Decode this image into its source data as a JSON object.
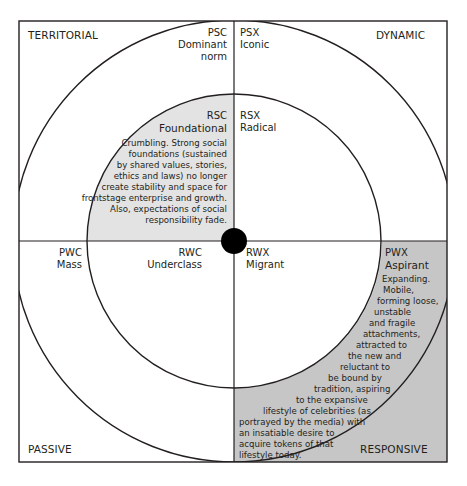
{
  "colors": {
    "background": "#ffffff",
    "line": "#231f20",
    "foundational_fill": "#e3e3e3",
    "aspirant_fill": "#c6c6c6",
    "center_dot": "#000000"
  },
  "corners": {
    "top_left": "TERRITORIAL",
    "top_right": "DYNAMIC",
    "bottom_left": "PASSIVE",
    "bottom_right": "RESPONSIVE"
  },
  "segments": {
    "psc": {
      "code": "PSC",
      "name_1": "Dominant",
      "name_2": "norm"
    },
    "psx": {
      "code": "PSX",
      "name": "Iconic"
    },
    "rsc": {
      "code": "RSC",
      "name": "Foundational",
      "description": [
        "Crumbling. Strong social",
        "foundations (sustained",
        "by shared values, stories,",
        "ethics and laws) no longer",
        "create stability and space for",
        "frontstage enterprise and growth.",
        "Also, expectations of social",
        "responsibility fade."
      ]
    },
    "rsx": {
      "code": "RSX",
      "name": "Radical"
    },
    "pwc": {
      "code": "PWC",
      "name": "Mass"
    },
    "rwc": {
      "code": "RWC",
      "name": "Underclass"
    },
    "rwx": {
      "code": "RWX",
      "name": "Migrant"
    },
    "pwx": {
      "code": "PWX",
      "name": "Aspirant",
      "description": [
        "Expanding.",
        "Mobile,",
        "forming loose,",
        "unstable",
        "and fragile",
        "attachments,",
        "attracted to",
        "the new and",
        "reluctant to",
        "be bound by",
        "tradition, aspiring",
        "to the expansive",
        "lifestyle of celebrities (as",
        "portrayed by the media) with",
        "an insatiable desire to",
        "acquire tokens of that",
        "lifestyle today."
      ]
    }
  }
}
